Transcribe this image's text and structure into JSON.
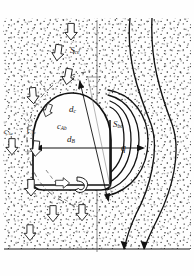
{
  "figure": {
    "background_color": "#fefefe",
    "ink_color": "#171717",
    "stipple_color": "#222222"
  },
  "labels": {
    "s_ce": {
      "text": "S",
      "sub": "ce",
      "x": 70,
      "y": 46
    },
    "d_c": {
      "text": "d",
      "sub": "c",
      "x": 69,
      "y": 110
    },
    "c_Ab": {
      "text": "c",
      "sub": "Ab",
      "x": 58,
      "y": 126
    },
    "d_B": {
      "text": "d",
      "sub": "B",
      "x": 68,
      "y": 140
    },
    "c_Ae": {
      "text": "c",
      "sub": "Ae",
      "x": 6,
      "y": 130
    },
    "c_Ac": {
      "text": "c",
      "sub": "Ac",
      "x": 28,
      "y": 128
    },
    "s_be": {
      "text": "S",
      "sub": "be",
      "x": 114,
      "y": 124
    },
    "q": {
      "text": "q",
      "sub": "",
      "x": 121,
      "y": 148
    }
  },
  "elements": {
    "bubble": {
      "name": "bubble-dome",
      "cx": 72,
      "cy": 137,
      "rx": 40,
      "ry": 45
    },
    "cloud": {
      "name": "cloud-boundary"
    },
    "wake": {
      "name": "wake-region"
    },
    "emulsion": {
      "name": "emulsion-phase-stipple"
    },
    "axis": {
      "name": "vertical-center-axis",
      "x": 97
    },
    "baseline": {
      "name": "bed-bottom-line",
      "y": 249
    },
    "diameter_arrow": {
      "name": "bubble-diameter-arrow"
    },
    "cloud_arrow": {
      "name": "cloud-diameter-arrow"
    },
    "flow_arrows": {
      "name": "gas-flow-block-arrows",
      "count": 12
    },
    "streamlines": {
      "name": "gas-streamlines",
      "count": 5
    }
  }
}
